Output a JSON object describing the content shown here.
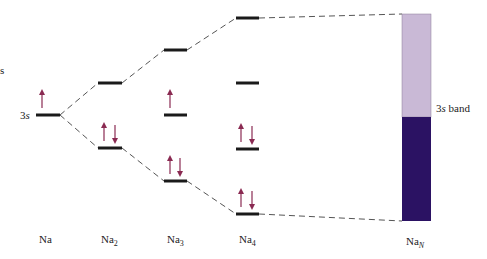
{
  "diagram": {
    "side_fragment": "s",
    "orbital_label": "3s",
    "orbital_label_num": "3",
    "orbital_label_italic": "s",
    "band_label_num": "3",
    "band_label_italic": "s",
    "band_label_rest": " band",
    "colors": {
      "level": "#1a1a1a",
      "arrow": "#8a2a52",
      "dash": "#555555",
      "band_empty": "#c9b9d6",
      "band_filled": "#2b1263"
    },
    "columns": [
      {
        "name": "Na",
        "sub": "",
        "x": 48,
        "levels": [
          {
            "y": 115,
            "electrons": "up"
          }
        ]
      },
      {
        "name": "Na",
        "sub": "2",
        "x": 110,
        "levels": [
          {
            "y": 83,
            "electrons": ""
          },
          {
            "y": 148,
            "electrons": "pair"
          }
        ]
      },
      {
        "name": "Na",
        "sub": "3",
        "x": 176,
        "levels": [
          {
            "y": 50,
            "electrons": ""
          },
          {
            "y": 115,
            "electrons": "up"
          },
          {
            "y": 181,
            "electrons": "pair"
          }
        ]
      },
      {
        "name": "Na",
        "sub": "4",
        "x": 248,
        "levels": [
          {
            "y": 18,
            "electrons": ""
          },
          {
            "y": 83,
            "electrons": ""
          },
          {
            "y": 149,
            "electrons": "pair"
          },
          {
            "y": 214,
            "electrons": "pair"
          }
        ]
      },
      {
        "name": "Na",
        "sub": "N",
        "x": 417
      }
    ],
    "band": {
      "x": 402,
      "width": 29,
      "top": 14,
      "split": 117,
      "bottom": 221
    }
  }
}
